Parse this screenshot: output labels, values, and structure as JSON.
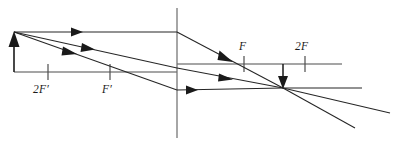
{
  "diagram": {
    "type": "thin-lens-ray-diagram",
    "canvas": {
      "width": 393,
      "height": 145
    },
    "optical_axis": {
      "name": "principal-axis",
      "left_segment": {
        "x1": 14,
        "y1": 72,
        "x2": 177,
        "y2": 72
      },
      "right_segment": {
        "x1": 177,
        "y1": 64,
        "x2": 342,
        "y2": 64
      }
    },
    "lens": {
      "name": "lens-plane",
      "x": 177,
      "y_top": 8,
      "y_bottom": 138
    },
    "object": {
      "name": "object-arrow",
      "x": 14,
      "base_y": 72,
      "tip_y": 33,
      "direction": "up"
    },
    "image": {
      "name": "image-arrow",
      "x": 283,
      "base_y": 64,
      "tip_y": 89,
      "direction": "down"
    },
    "convergence_point": {
      "x": 283,
      "y": 88
    },
    "focal_marks": [
      {
        "id": "two-f-prime",
        "label_prefix": "2",
        "label_letter": "F",
        "label_prime": "′",
        "label_text": "2F′",
        "tick_x": 48,
        "tick_y_top": 64,
        "tick_y_bottom": 80,
        "label_x": 33,
        "label_y": 93,
        "side": "object"
      },
      {
        "id": "f-prime",
        "label_prefix": "",
        "label_letter": "F",
        "label_prime": "′",
        "label_text": "F′",
        "tick_x": 110,
        "tick_y_top": 64,
        "tick_y_bottom": 80,
        "label_x": 102,
        "label_y": 93,
        "side": "object"
      },
      {
        "id": "f",
        "label_prefix": "",
        "label_letter": "F",
        "label_prime": "",
        "label_text": "F",
        "tick_x": 244,
        "tick_y_top": 56,
        "tick_y_bottom": 72,
        "label_x": 239,
        "label_y": 50,
        "side": "image"
      },
      {
        "id": "two-f",
        "label_prefix": "2",
        "label_letter": "F",
        "label_prime": "",
        "label_text": "2F",
        "tick_x": 305,
        "tick_y_top": 56,
        "tick_y_bottom": 72,
        "label_x": 295,
        "label_y": 50,
        "side": "image"
      }
    ],
    "rays": [
      {
        "id": "ray-parallel",
        "name": "parallel-ray",
        "description": "From object tip parallel to axis, refracts through F",
        "incident": {
          "x1": 14,
          "y1": 32,
          "x2": 177,
          "y2": 32
        },
        "refracted": {
          "x1": 177,
          "y1": 32,
          "x2": 283,
          "y2": 88
        },
        "extension": {
          "x1": 283,
          "y1": 88,
          "x2": 355,
          "y2": 128
        },
        "arrowheads": [
          {
            "x": 78,
            "y": 32,
            "angle": 0
          },
          {
            "x": 231,
            "y": 60,
            "angle": 27.9
          }
        ]
      },
      {
        "id": "ray-center",
        "name": "center-ray",
        "description": "From object tip through optical centre of lens, undeviated",
        "incident": {
          "x1": 14,
          "y1": 32,
          "x2": 177,
          "y2": 68
        },
        "refracted": {
          "x1": 177,
          "y1": 68,
          "x2": 283,
          "y2": 88
        },
        "extension": {
          "x1": 283,
          "y1": 88,
          "x2": 390,
          "y2": 113
        },
        "arrowheads": [
          {
            "x": 90,
            "y": 49,
            "angle": 12.4
          },
          {
            "x": 228,
            "y": 78,
            "angle": 10.7
          }
        ]
      },
      {
        "id": "ray-focal",
        "name": "focal-ray",
        "description": "From object tip through F′, refracts parallel to axis",
        "incident": {
          "x1": 14,
          "y1": 32,
          "x2": 177,
          "y2": 90
        },
        "refracted": {
          "x1": 177,
          "y1": 90,
          "x2": 283,
          "y2": 88
        },
        "extension": {
          "x1": 283,
          "y1": 88,
          "x2": 362,
          "y2": 88
        },
        "arrowheads": [
          {
            "x": 72,
            "y": 53,
            "angle": 19.6
          },
          {
            "x": 196,
            "y": 90,
            "angle": 0
          }
        ]
      }
    ]
  }
}
